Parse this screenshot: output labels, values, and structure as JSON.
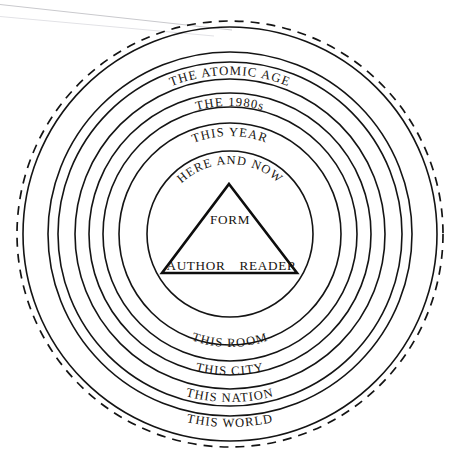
{
  "figure": {
    "background_color": "#ffffff",
    "ink_color": "#17140f",
    "artifact_color": "#c9c9cd"
  },
  "center": {
    "x": 230,
    "y": 234
  },
  "rings": [
    {
      "id": "ring-world",
      "label": "THIS WORLD",
      "radius": 207,
      "dashed": false,
      "label_arc": "bottom",
      "label_size": 12.6,
      "label_offset": 14
    },
    {
      "id": "ring-nation",
      "label": "THIS NATION",
      "radius": 182,
      "dashed": false,
      "label_arc": "bottom",
      "label_size": 12.6,
      "label_offset": 14
    },
    {
      "id": "ring-city",
      "label": "THIS CITY",
      "radius": 155,
      "dashed": false,
      "label_arc": "bottom",
      "label_size": 12.6,
      "label_offset": 14
    },
    {
      "id": "ring-room",
      "label": "THIS ROOM",
      "radius": 127,
      "dashed": false,
      "label_arc": "bottom",
      "label_size": 12.6,
      "label_offset": 14
    },
    {
      "id": "ring-here-and-now",
      "label": "HERE AND NOW",
      "radius": 83,
      "dashed": false,
      "label_arc": "top",
      "label_size": 12.4,
      "label_offset": 13
    },
    {
      "id": "ring-this-year",
      "label": "THIS YEAR",
      "radius": 111,
      "dashed": false,
      "label_arc": "top",
      "label_size": 12.6,
      "label_offset": 13
    },
    {
      "id": "ring-the-1980s",
      "label": "THE 1980s",
      "radius": 141,
      "dashed": false,
      "label_arc": "top",
      "label_size": 12.6,
      "label_offset": 13
    },
    {
      "id": "ring-atomic-age",
      "label": "THE ATOMIC AGE",
      "radius": 172,
      "dashed": false,
      "label_arc": "top",
      "label_size": 12.8,
      "label_offset": 13
    },
    {
      "id": "ring-outermost",
      "label": "",
      "radius": 213,
      "dashed": true,
      "label_arc": "none",
      "label_size": 0,
      "label_offset": 0
    }
  ],
  "triangle": {
    "apex": {
      "x": 229,
      "y": 184
    },
    "bottom_left": {
      "x": 162,
      "y": 273
    },
    "bottom_right": {
      "x": 297,
      "y": 273
    },
    "nodes": [
      {
        "id": "node-form",
        "label": "FORM",
        "x": 230,
        "y": 224,
        "size": 13.2
      },
      {
        "id": "node-author",
        "label": "AUTHOR",
        "x": 196,
        "y": 270,
        "size": 13.2
      },
      {
        "id": "node-reader",
        "label": "READER",
        "x": 268,
        "y": 270,
        "size": 13.2
      }
    ]
  },
  "ordered_ring_labels_outward": [
    "HERE AND NOW",
    "THIS YEAR",
    "THE 1980s",
    "THE ATOMIC AGE",
    "THIS ROOM",
    "THIS CITY",
    "THIS NATION",
    "THIS WORLD"
  ]
}
